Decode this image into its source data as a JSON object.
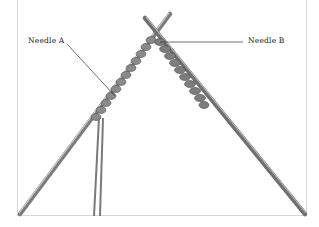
{
  "diagram": {
    "labels": [
      {
        "id": "needle-a",
        "text": "Needle A"
      },
      {
        "id": "needle-b",
        "text": "Needle B"
      }
    ],
    "colors": {
      "frame_border": "#d6d6d6",
      "needle": "#8a8a8a",
      "yarn": "#7a7a7a",
      "leader_line": "#333333",
      "label_text": "#222222"
    }
  }
}
